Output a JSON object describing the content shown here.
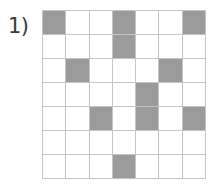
{
  "item": {
    "label": "1)"
  },
  "grid": {
    "rows": 7,
    "columns": 7,
    "shaded_color": "#9b9b9b",
    "empty_color": "#ffffff",
    "line_color": "#c4c4c4",
    "shaded_count": 11,
    "cells": [
      [
        1,
        0,
        0,
        1,
        0,
        0,
        1
      ],
      [
        0,
        0,
        0,
        1,
        0,
        0,
        0
      ],
      [
        0,
        1,
        0,
        0,
        0,
        1,
        0
      ],
      [
        0,
        0,
        0,
        0,
        1,
        0,
        0
      ],
      [
        0,
        0,
        1,
        0,
        1,
        0,
        1
      ],
      [
        0,
        0,
        0,
        0,
        0,
        0,
        0
      ],
      [
        0,
        0,
        0,
        1,
        0,
        0,
        0
      ]
    ]
  }
}
